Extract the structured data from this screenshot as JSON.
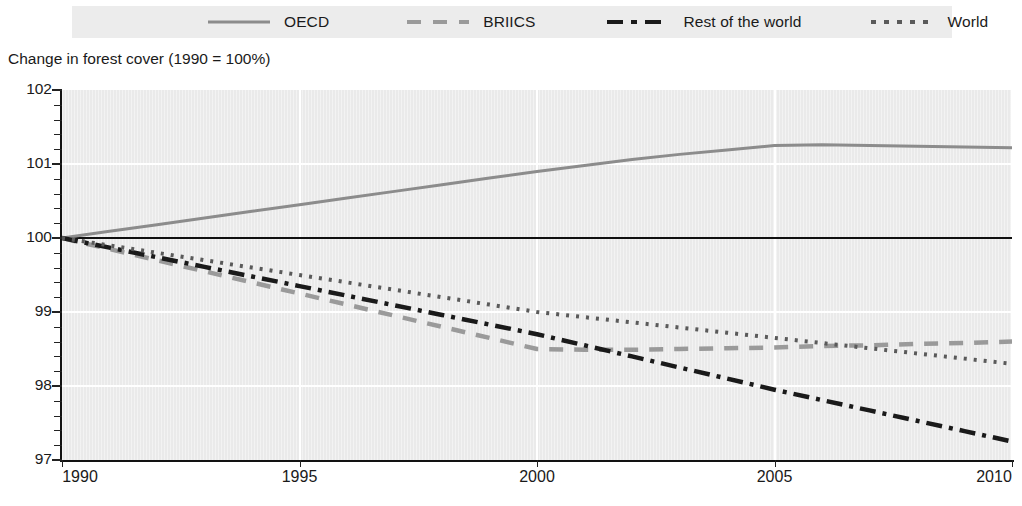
{
  "subtitle": "Change in forest cover (1990 = 100%)",
  "legend": {
    "entries": [
      {
        "label": "OECD",
        "style": "solid",
        "color": "#8c8c8c"
      },
      {
        "label": "BRIICS",
        "style": "dashed",
        "color": "#9a9a9a"
      },
      {
        "label": "Rest of the world",
        "style": "dashdot",
        "color": "#1a1a1a"
      },
      {
        "label": "World",
        "style": "dotted",
        "color": "#5a5a5a"
      }
    ]
  },
  "axes": {
    "y_ticks": [
      "102",
      "101",
      "100",
      "99",
      "98",
      "97"
    ],
    "x_ticks": [
      "1990",
      "1995",
      "2000",
      "2005",
      "2010"
    ]
  },
  "chart_data": {
    "type": "line",
    "title": "",
    "subtitle": "Change in forest cover (1990 = 100%)",
    "xlabel": "",
    "ylabel": "Change in forest cover (1990 = 100%)",
    "xlim": [
      1990,
      2010
    ],
    "ylim": [
      97,
      102
    ],
    "y_tick_values": [
      97,
      98,
      99,
      100,
      101,
      102
    ],
    "y_minor_tick_interval": 0.2,
    "x_tick_values": [
      1990,
      1995,
      2000,
      2005,
      2010
    ],
    "grid": "horizontal and vertical white gridlines at major ticks",
    "legend_position": "top",
    "reference_line": {
      "value": 100,
      "color": "#101010",
      "style": "solid"
    },
    "x": [
      1990,
      1991,
      1992,
      1993,
      1994,
      1995,
      1996,
      1997,
      1998,
      1999,
      2000,
      2001,
      2002,
      2003,
      2004,
      2005,
      2006,
      2007,
      2008,
      2009,
      2010
    ],
    "series": [
      {
        "name": "OECD",
        "style": "solid",
        "color": "#8c8c8c",
        "values": [
          100.0,
          100.09,
          100.18,
          100.27,
          100.36,
          100.45,
          100.54,
          100.63,
          100.72,
          100.81,
          100.9,
          100.98,
          101.06,
          101.13,
          101.19,
          101.25,
          101.26,
          101.25,
          101.24,
          101.23,
          101.22
        ]
      },
      {
        "name": "BRIICS",
        "style": "dashed",
        "color": "#9a9a9a",
        "values": [
          100.0,
          99.85,
          99.7,
          99.55,
          99.4,
          99.25,
          99.1,
          98.95,
          98.8,
          98.65,
          98.5,
          98.49,
          98.49,
          98.5,
          98.51,
          98.52,
          98.54,
          98.55,
          98.57,
          98.58,
          98.6
        ]
      },
      {
        "name": "Rest of the world",
        "style": "dashdot",
        "color": "#1a1a1a",
        "values": [
          100.0,
          99.87,
          99.74,
          99.61,
          99.48,
          99.35,
          99.22,
          99.09,
          98.96,
          98.83,
          98.7,
          98.55,
          98.4,
          98.25,
          98.1,
          97.95,
          97.81,
          97.67,
          97.53,
          97.39,
          97.25
        ]
      },
      {
        "name": "World",
        "style": "dotted",
        "color": "#5a5a5a",
        "values": [
          100.0,
          99.9,
          99.8,
          99.7,
          99.6,
          99.5,
          99.4,
          99.3,
          99.2,
          99.1,
          99.0,
          98.93,
          98.86,
          98.79,
          98.72,
          98.65,
          98.58,
          98.51,
          98.44,
          98.37,
          98.3
        ]
      }
    ]
  }
}
